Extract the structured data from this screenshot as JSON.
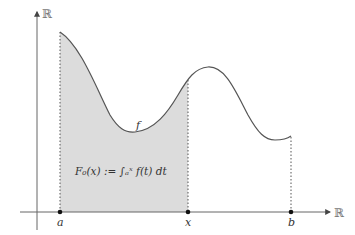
{
  "diagram": {
    "axis_labels": {
      "x": "ℝ",
      "y": "ℝ"
    },
    "points": {
      "a": "a",
      "x": "x",
      "b": "b"
    },
    "function_label": "f",
    "formula": "F₀(x) := ∫ₐˣ f(t) dt",
    "colors": {
      "curve": "#555555",
      "fill": "#d9d9d9",
      "axis": "#666666",
      "dots": "#111111"
    }
  }
}
